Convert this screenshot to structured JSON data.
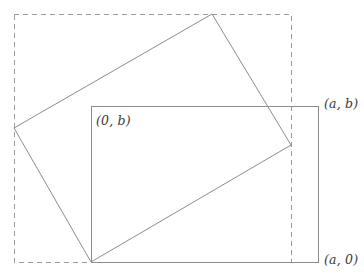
{
  "figure": {
    "canvas": {
      "width": 364,
      "height": 278,
      "background": "#ffffff"
    },
    "stroke_color": "#8c8c8c",
    "dashed_color": "#9a9a9a",
    "label_color": "#3a3a3a",
    "labels": {
      "origin_top": "(0, b)",
      "corner_top_right": "(a, b)",
      "corner_bottom_right": "(a, 0)"
    }
  },
  "chart_data": {
    "type": "diagram",
    "xlabel": "",
    "ylabel": "",
    "grid": false,
    "legend": "none",
    "xlim": [
      0,
      364
    ],
    "ylim": [
      0,
      278
    ],
    "shapes": [
      {
        "name": "bounding-box-dashed",
        "type": "rectangle",
        "style": "dashed",
        "stroke": "#9a9a9a",
        "fill": "none",
        "points": [
          [
            14,
            14
          ],
          [
            291,
            14
          ],
          [
            291,
            262
          ],
          [
            14,
            262
          ]
        ]
      },
      {
        "name": "axis-aligned-rectangle",
        "type": "rectangle",
        "style": "solid",
        "stroke": "#8c8c8c",
        "fill": "none",
        "points": [
          [
            91,
            106
          ],
          [
            318,
            106
          ],
          [
            318,
            262
          ],
          [
            91,
            262
          ]
        ]
      },
      {
        "name": "rotated-rectangle",
        "type": "quadrilateral",
        "style": "solid",
        "stroke": "#8c8c8c",
        "fill": "none",
        "points": [
          [
            212,
            14
          ],
          [
            291,
            145
          ],
          [
            91,
            262
          ],
          [
            14,
            128
          ]
        ]
      }
    ],
    "annotations": [
      {
        "name": "label-origin-top",
        "text": "(0, b)",
        "x": 96,
        "y": 122
      },
      {
        "name": "label-corner-top-right",
        "text": "(a, b)",
        "x": 324,
        "y": 106
      },
      {
        "name": "label-corner-bottom-right",
        "text": "(a, 0)",
        "x": 324,
        "y": 262
      }
    ]
  }
}
